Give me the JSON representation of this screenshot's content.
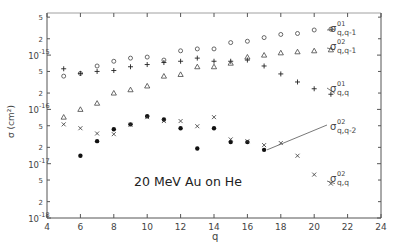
{
  "chart_data": {
    "type": "scatter",
    "title": "",
    "annotation": "20 MeV  Au  on  He",
    "xlabel": "q",
    "ylabel": "σ (cm²)",
    "xlim": [
      4,
      24
    ],
    "ylim": [
      1e-18,
      7e-15
    ],
    "yscale": "log",
    "grid": false,
    "x_ticks": [
      4,
      6,
      8,
      10,
      12,
      14,
      16,
      18,
      20,
      22,
      24
    ],
    "y_ticks_major": [
      "10^-15",
      "10^-16",
      "10^-17",
      "10^-18"
    ],
    "y_ticks_minor_labels": [
      "5",
      "2",
      "5",
      "2",
      "5",
      "2",
      "5",
      "2"
    ],
    "series": [
      {
        "name": "σ^01_{q,q-1}",
        "label_super": "01",
        "label_sub": "q,q-1",
        "marker": "circle-open",
        "x": [
          5,
          6,
          7,
          8,
          9,
          10,
          11,
          12,
          13,
          14,
          15,
          16,
          17,
          18,
          19,
          20,
          21
        ],
        "values": [
          4.1e-16,
          4.6e-16,
          6.3e-16,
          7.7e-16,
          8.8e-16,
          9.2e-16,
          8.1e-16,
          1.2e-15,
          1.3e-15,
          1.3e-15,
          1.7e-15,
          1.8e-15,
          2.1e-15,
          2.4e-15,
          2.5e-15,
          2.9e-15,
          3e-15
        ]
      },
      {
        "name": "σ^01_{q,q}",
        "label_super": "01",
        "label_sub": "q,q",
        "marker": "plus",
        "x": [
          5,
          6,
          7,
          8,
          9,
          10,
          11,
          12,
          13,
          14,
          15,
          16,
          17,
          18,
          19,
          20,
          21
        ],
        "values": [
          5.6e-16,
          4.6e-16,
          5e-16,
          5.2e-16,
          6.1e-16,
          6.7e-16,
          7.3e-16,
          7.7e-16,
          8.8e-16,
          7.7e-16,
          7.7e-16,
          8.1e-16,
          6.3e-16,
          4.5e-16,
          3.2e-16,
          2.4e-16,
          1.9e-16
        ]
      },
      {
        "name": "σ^02_{q,q-1}",
        "label_super": "02",
        "label_sub": "q,q-1",
        "marker": "triangle-open",
        "x": [
          5,
          6,
          7,
          8,
          9,
          10,
          11,
          12,
          13,
          14,
          15,
          16,
          17,
          18,
          19,
          20,
          21
        ],
        "values": [
          7.2e-17,
          1e-16,
          1.3e-16,
          2e-16,
          2.3e-16,
          2.7e-16,
          4.1e-16,
          4.4e-16,
          6.1e-16,
          6.1e-16,
          7.1e-16,
          9.2e-16,
          1e-15,
          1.1e-15,
          1.15e-15,
          1.2e-15,
          1.25e-15
        ]
      },
      {
        "name": "σ^02_{q,q-2}",
        "label_super": "02",
        "label_sub": "q,q-2",
        "marker": "circle-filled",
        "x": [
          6,
          7,
          8,
          9,
          10,
          11,
          12,
          13,
          14,
          15,
          16,
          17
        ],
        "values": [
          1.4e-17,
          2.6e-17,
          4.3e-17,
          5.3e-17,
          7.5e-17,
          6.5e-17,
          4.5e-17,
          1.9e-17,
          4.5e-17,
          2.5e-17,
          2.5e-17,
          1.8e-17
        ]
      },
      {
        "name": "σ^02_{q,q}",
        "label_super": "02",
        "label_sub": "q,q",
        "marker": "cross",
        "x": [
          5,
          6,
          7,
          8,
          9,
          10,
          11,
          12,
          13,
          14,
          15,
          16,
          17,
          18,
          19,
          20,
          21
        ],
        "values": [
          5.3e-17,
          4.5e-17,
          3.6e-17,
          3.5e-17,
          5.2e-17,
          7.2e-17,
          6.1e-17,
          6.1e-17,
          4.9e-17,
          7.2e-17,
          2.8e-17,
          2.6e-17,
          2.2e-17,
          2.4e-17,
          1.4e-17,
          6.3e-18,
          4.3e-18
        ]
      }
    ]
  },
  "labels": {
    "ylabel": "σ (cm²)",
    "xlabel": "q",
    "annotation": "20 MeV  Au  on  He",
    "sigma": "σ",
    "legend": [
      {
        "sup": "01",
        "sub": "q,q-1"
      },
      {
        "sup": "02",
        "sub": "q,q-1"
      },
      {
        "sup": "01",
        "sub": "q,q"
      },
      {
        "sup": "02",
        "sub": "q,q-2"
      },
      {
        "sup": "02",
        "sub": "q,q"
      }
    ]
  }
}
